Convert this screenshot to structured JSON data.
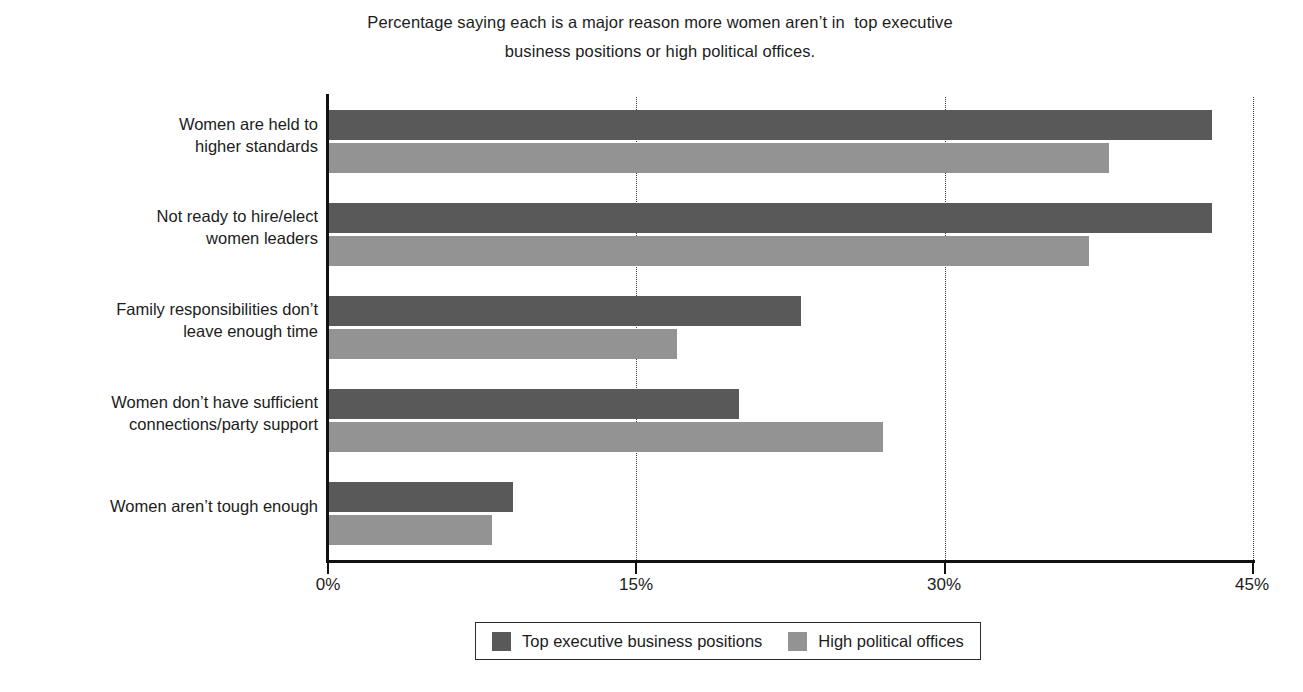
{
  "chart_data": {
    "type": "bar",
    "orientation": "horizontal",
    "title": "Percentage saying each is a major reason more women aren’t in  top executive business positions or high political offices.",
    "title_lines": [
      "Percentage saying each is a major reason more women aren’t in  top executive",
      "business positions or high political offices."
    ],
    "xlabel": "",
    "ylabel": "",
    "xlim": [
      0,
      45
    ],
    "xticks": [
      0,
      15,
      30,
      45
    ],
    "xtick_labels": [
      "0%",
      "15%",
      "30%",
      "45%"
    ],
    "grid": "vertical-dotted",
    "gridlines_at": [
      15,
      30,
      45
    ],
    "legend_position": "bottom",
    "categories": [
      "Women are held to\nhigher standards",
      "Not ready to hire/elect\nwomen leaders",
      "Family responsibilities don’t\nleave enough time",
      "Women don’t have sufficient\nconnections/party support",
      "Women aren’t tough enough"
    ],
    "series": [
      {
        "name": "Top executive business positions",
        "color": "#595959",
        "values": [
          43,
          43,
          23,
          20,
          9
        ]
      },
      {
        "name": "High political offices",
        "color": "#939393",
        "values": [
          38,
          37,
          17,
          27,
          8
        ]
      }
    ]
  },
  "legend": {
    "entries": [
      {
        "label": "Top executive business positions",
        "swatch": "series-a"
      },
      {
        "label": "High political offices",
        "swatch": "series-b"
      }
    ]
  },
  "colors": {
    "series_a": "#595959",
    "series_b": "#939393",
    "axis": "#111111",
    "grid": "#3a3a3a",
    "text": "#1c1c1c",
    "background": "#ffffff"
  }
}
